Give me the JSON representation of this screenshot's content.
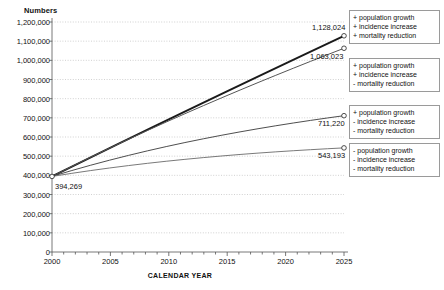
{
  "chart_data": {
    "type": "line",
    "title": "",
    "xlabel": "CALENDAR YEAR",
    "ylabel": "Numbers",
    "xlim": [
      2000,
      2025
    ],
    "ylim": [
      0,
      1200000
    ],
    "grid": true,
    "legend_position": "right",
    "x": [
      2000,
      2025
    ],
    "xticks": [
      "2000",
      "2005",
      "2010",
      "2015",
      "2020",
      "2025"
    ],
    "xtick_values": [
      2000,
      2005,
      2010,
      2015,
      2020,
      2025
    ],
    "yticks": [
      "0",
      "100,000",
      "200,000",
      "300,000",
      "400,000",
      "500,000",
      "600,000",
      "700,000",
      "800,000",
      "900,000",
      "1,000,000",
      "1,100,000",
      "1,200,000"
    ],
    "ytick_values": [
      0,
      100000,
      200000,
      300000,
      400000,
      500000,
      600000,
      700000,
      800000,
      900000,
      1000000,
      1100000,
      1200000
    ],
    "start_label": "394,269",
    "start_value": 394269,
    "series": [
      {
        "name": "+ population growth / + incidence increase / + mortality reduction",
        "end_label": "1,128,024",
        "values": [
          394269,
          1128024
        ],
        "color": "#1a1a1a",
        "width": 1.9
      },
      {
        "name": "+ population growth / + incidence increase / - mortality reduction",
        "end_label": "1,063,023",
        "values": [
          394269,
          1063023
        ],
        "color": "#555555",
        "width": 1.0
      },
      {
        "name": "+ population growth / - incidence increase / - mortality reduction",
        "end_label": "711,220",
        "values": [
          394269,
          711220
        ],
        "color": "#3a3a3a",
        "width": 0.9
      },
      {
        "name": "- population growth / - incidence increase / - mortality reduction",
        "end_label": "543,193",
        "values": [
          394269,
          543193
        ],
        "color": "#6a6a6a",
        "width": 0.9
      }
    ],
    "legend": [
      {
        "l1": "+ population growth",
        "l2": "+ incidence increase",
        "l3": "+ mortality reduction"
      },
      {
        "l1": "+ population growth",
        "l2": "+ incidence increase",
        "l3": "- mortality reduction"
      },
      {
        "l1": "+ population growth",
        "l2": "- incidence increase",
        "l3": "- mortality reduction"
      },
      {
        "l1": "- population growth",
        "l2": "- incidence increase",
        "l3": "- mortality reduction"
      }
    ]
  }
}
